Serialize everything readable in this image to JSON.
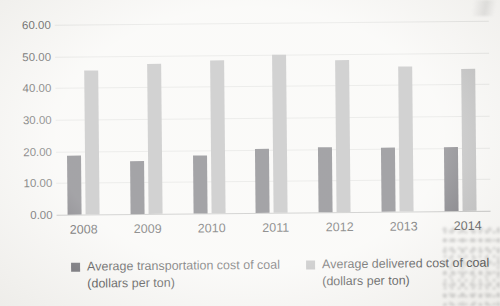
{
  "chart_data": {
    "type": "bar",
    "title": "",
    "categories": [
      "2008",
      "2009",
      "2010",
      "2011",
      "2012",
      "2013",
      "2014"
    ],
    "series": [
      {
        "name": "Average transportation cost of coal (dollars per ton)",
        "color": "#49484f",
        "values": [
          18.7,
          16.8,
          18.2,
          20.2,
          20.4,
          20.2,
          20.3
        ]
      },
      {
        "name": "Average delivered cost of coal (dollars per ton)",
        "color": "#a5a5a5",
        "values": [
          45.5,
          47.5,
          48.2,
          49.8,
          48.0,
          45.8,
          44.8
        ]
      }
    ],
    "xlabel": "",
    "ylabel": "",
    "ylim": [
      0,
      60
    ],
    "ytick_step": 10,
    "ytick_labels": [
      "0.00",
      "10.00",
      "20.00",
      "30.00",
      "40.00",
      "50.00",
      "60.00"
    ],
    "grid": true,
    "legend_position": "bottom"
  },
  "legend": {
    "items": [
      {
        "line1": "Average transportation cost of coal",
        "line2": "(dollars per ton)",
        "color": "#49484f"
      },
      {
        "line1": "Average delivered cost of coal",
        "line2": "(dollars per ton)",
        "color": "#a5a5a5"
      }
    ]
  },
  "colors": {
    "background": "#f6f5f2",
    "gridline": "#dadad7",
    "axis_line": "#aaaaa8",
    "tick_text": "#3a3a3a",
    "category_text": "#242424"
  }
}
